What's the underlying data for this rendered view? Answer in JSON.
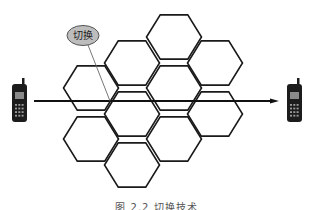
{
  "figure": {
    "callout_label": "切换",
    "caption": "图 2.2  切换技术",
    "colors": {
      "background": "#ffffff",
      "hex_stroke": "#1a1a1a",
      "arrow": "#111111",
      "callout_fill": "#bdbdbd",
      "callout_stroke": "#555555",
      "callout_pointer": "#666666",
      "phone_body": "#1c1c1c",
      "phone_screen": "#8a8a8a"
    },
    "cells": [
      {
        "cx": 91,
        "cy": 88
      },
      {
        "cx": 91,
        "cy": 139
      },
      {
        "cx": 132,
        "cy": 63
      },
      {
        "cx": 132,
        "cy": 114
      },
      {
        "cx": 132,
        "cy": 165
      },
      {
        "cx": 174,
        "cy": 37
      },
      {
        "cx": 174,
        "cy": 88
      },
      {
        "cx": 174,
        "cy": 139
      },
      {
        "cx": 215,
        "cy": 63
      },
      {
        "cx": 215,
        "cy": 114
      }
    ],
    "cell_radius": 27.5,
    "arrow": {
      "x1": 34,
      "y1": 101,
      "x2": 279,
      "y2": 101
    },
    "phones": [
      {
        "name": "source-phone",
        "x": 12,
        "y": 78
      },
      {
        "name": "destination-phone",
        "x": 287,
        "y": 78
      }
    ],
    "callout": {
      "cx": 83,
      "cy": 35.5,
      "rx": 16,
      "ry": 10,
      "pointer_from": [
        88,
        45
      ],
      "pointer_to": [
        110,
        101
      ]
    }
  }
}
